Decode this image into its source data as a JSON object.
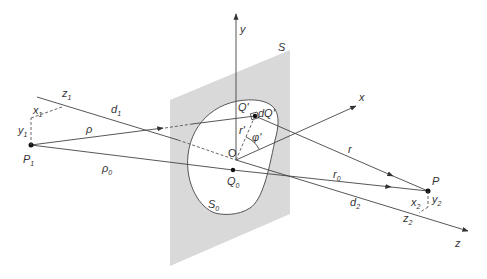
{
  "diagram": {
    "colors": {
      "plane": "#d9d9d9",
      "line": "#444444",
      "background": "#ffffff"
    },
    "labels": {
      "y_axis": "y",
      "x_axis": "x",
      "z_axis": "z",
      "plane": "S",
      "aperture": "S",
      "aperture_sub": "0",
      "origin": "O",
      "q0": "Q",
      "q0_sub": "0",
      "qprime": "Q'",
      "dq": "dQ'",
      "rprime": "r'",
      "phiprime": "φ'",
      "r": "r",
      "r0": "r",
      "r0_sub": "0",
      "rho": "ρ",
      "rho0": "ρ",
      "rho0_sub": "0",
      "d1": "d",
      "d1_sub": "1",
      "d2": "d",
      "d2_sub": "2",
      "z1": "z",
      "z1_sub": "1",
      "x1": "x",
      "x1_sub": "1",
      "y1": "y",
      "y1_sub": "1",
      "p1": "P",
      "p1_sub": "1",
      "p": "P",
      "x2": "x",
      "x2_sub": "2",
      "y2": "y",
      "y2_sub": "2",
      "z2": "z",
      "z2_sub": "2"
    }
  }
}
